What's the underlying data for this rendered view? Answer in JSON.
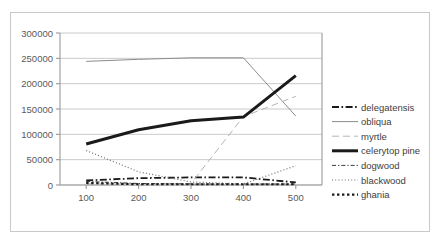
{
  "chart_data": {
    "type": "line",
    "title": "",
    "subtitle": "",
    "xlabel": "",
    "ylabel": "",
    "x": [
      100,
      200,
      300,
      400,
      500
    ],
    "categories": [
      "100",
      "200",
      "300",
      "400",
      "500"
    ],
    "xlim": [
      50,
      550
    ],
    "ylim": [
      0,
      300000
    ],
    "y_ticks": [
      0,
      50000,
      100000,
      150000,
      200000,
      250000,
      300000
    ],
    "y_tick_labels": [
      "0",
      "50000",
      "100000",
      "150000",
      "200000",
      "250000",
      "300000"
    ],
    "x_tick_labels": [
      "100",
      "200",
      "300",
      "400",
      "500"
    ],
    "grid": "horizontal",
    "legend_position": "right",
    "series": [
      {
        "name": "delegatensis",
        "values": [
          9000,
          13500,
          15000,
          15000,
          5000
        ],
        "style": "dash-dot",
        "color": "#1a1a1a",
        "width": 1.8
      },
      {
        "name": "obliqua",
        "values": [
          244000,
          248000,
          251000,
          251000,
          136000
        ],
        "style": "solid",
        "color": "#8c8c8c",
        "width": 1.0
      },
      {
        "name": "myrtle",
        "values": [
          2000,
          2500,
          3000,
          135000,
          175000
        ],
        "style": "long-dash",
        "color": "#b5b5b5",
        "width": 1.0
      },
      {
        "name": "celerytop pine",
        "values": [
          81000,
          109000,
          127000,
          134000,
          216000
        ],
        "style": "solid",
        "color": "#1a1a1a",
        "width": 3.0
      },
      {
        "name": "dogwood",
        "values": [
          7000,
          3000,
          2000,
          2000,
          2000
        ],
        "style": "dash-dot-short",
        "color": "#3c3c3c",
        "width": 1.0
      },
      {
        "name": "blackwood",
        "values": [
          68000,
          26000,
          6000,
          2000,
          38000
        ],
        "style": "dotted",
        "color": "#6e6e6e",
        "width": 1.2
      },
      {
        "name": "ghania",
        "values": [
          4000,
          1500,
          1500,
          1500,
          1500
        ],
        "style": "dotted-thick",
        "color": "#1a1a1a",
        "width": 2.2
      }
    ]
  },
  "legend": {
    "items": [
      {
        "label": "delegatensis"
      },
      {
        "label": "obliqua"
      },
      {
        "label": "myrtle"
      },
      {
        "label": "celerytop pine"
      },
      {
        "label": "dogwood"
      },
      {
        "label": "blackwood"
      },
      {
        "label": "ghania"
      }
    ]
  },
  "colors": {
    "frame": "#c9c9c9",
    "axis": "#9a9a9a",
    "grid": "#c4c4c4",
    "text": "#5a5a5a",
    "background": "#ffffff"
  }
}
